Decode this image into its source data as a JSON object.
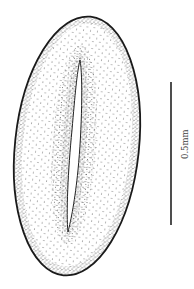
{
  "figure": {
    "scale_bar": {
      "label": "0.5mm",
      "orientation": "vertical"
    },
    "colors": {
      "background": "#ffffff",
      "ink": "#222222",
      "label": "#444444"
    }
  }
}
